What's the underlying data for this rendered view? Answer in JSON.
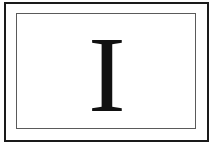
{
  "card": {
    "letter": "I",
    "colors": {
      "outer_border": "#1a1a1a",
      "inner_border": "#5a5a5a",
      "letter": "#111111",
      "background": "#ffffff"
    }
  }
}
